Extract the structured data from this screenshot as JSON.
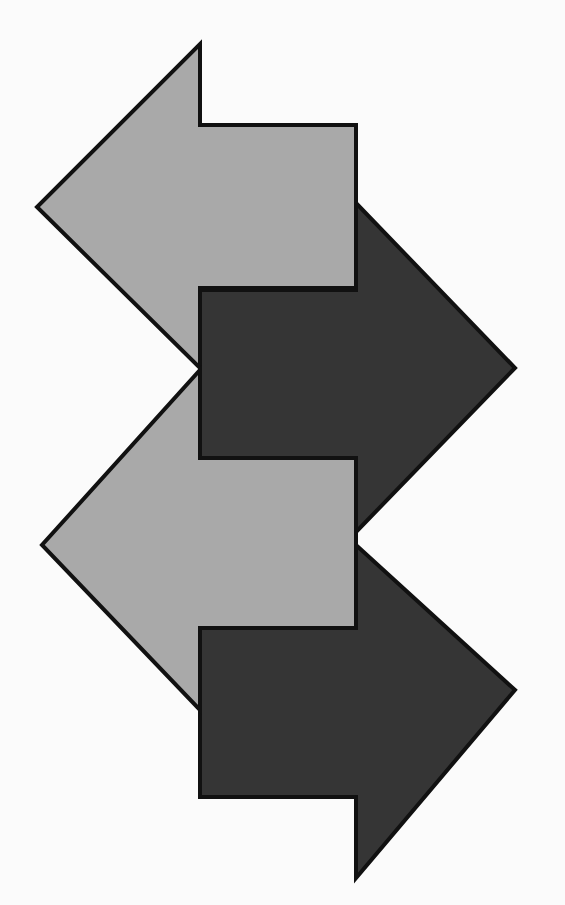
{
  "diagram": {
    "title": "",
    "background": "#fbfbfb",
    "colors": {
      "light_arrow_fill": "#a9a9a9",
      "dark_arrow_fill": "#353535",
      "outline": "#111111"
    },
    "arrows": [
      {
        "id": "top-dark-right",
        "direction": "right",
        "shade": "dark",
        "points": "200,290 356,290 356,203 515,368 356,532 356,458 200,458"
      },
      {
        "id": "top-light-left",
        "direction": "left",
        "shade": "light",
        "points": "200,44 200,125 356,125 356,288 200,288 200,368 37,207"
      },
      {
        "id": "bottom-dark-right",
        "direction": "right",
        "shade": "dark",
        "points": "200,628 356,628 356,545 515,690 356,878 356,797 200,797"
      },
      {
        "id": "bottom-light-left",
        "direction": "left",
        "shade": "light",
        "points": "200,370 200,458 356,458 356,628 200,628 200,710 42,545"
      }
    ]
  }
}
